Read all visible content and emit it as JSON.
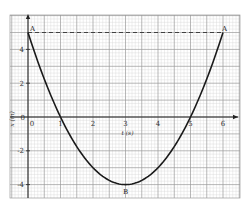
{
  "chart_data": {
    "type": "line",
    "title": "",
    "xlabel": "t (s)",
    "ylabel": "x (m)",
    "xlim": [
      -0.55,
      6.55
    ],
    "ylim": [
      -5.05,
      5.85
    ],
    "grid": true,
    "x_ticks": [
      0,
      1,
      2,
      3,
      4,
      5,
      6
    ],
    "x_tick_labels": [
      "0",
      "1",
      "2",
      "3",
      "4",
      "5",
      "6"
    ],
    "y_ticks": [
      -4,
      -2,
      0,
      2,
      4
    ],
    "y_tick_labels": [
      "-4",
      "-2",
      "0",
      "2",
      "4"
    ],
    "series": [
      {
        "name": "x(t) = t^2 - 6t + 5",
        "x": [
          0,
          0.5,
          1,
          1.5,
          2,
          2.5,
          3,
          3.5,
          4,
          4.5,
          5,
          5.5,
          6
        ],
        "values": [
          5,
          2.25,
          0,
          -1.75,
          -3,
          -3.75,
          -4,
          -3.75,
          -3,
          -1.75,
          0,
          2.25,
          5
        ]
      }
    ],
    "annotations": [
      {
        "label": "A",
        "x": 0,
        "y": 5
      },
      {
        "label": "A",
        "x": 6,
        "y": 5
      },
      {
        "label": "B",
        "x": 3,
        "y": -4
      }
    ],
    "reference_lines": [
      {
        "type": "horizontal",
        "y": 5,
        "style": "dashed",
        "from_x": 0,
        "to_x": 6
      }
    ],
    "legend": null
  },
  "labels": {
    "x_axis": "t (s)",
    "y_axis": "x (m)",
    "point_a_left": "A",
    "point_a_right": "A",
    "point_b": "B"
  },
  "colors": {
    "grid_minor": "#d6d6d6",
    "grid_major": "#9a9a9a",
    "curve": "#1a1a1a",
    "axis": "#222222",
    "background": "#ffffff"
  }
}
